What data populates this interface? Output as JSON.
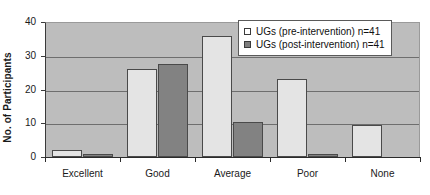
{
  "chart_data": {
    "type": "bar",
    "title": "",
    "xlabel": "",
    "ylabel": "No. of Participants",
    "ylim": [
      0,
      40
    ],
    "yticks": [
      0,
      10,
      20,
      30,
      40
    ],
    "grid": true,
    "legend_position": "top-right",
    "categories": [
      "Excellent",
      "Good",
      "Average",
      "Poor",
      "None"
    ],
    "series": [
      {
        "name": "UGs (pre-intervention) n=41",
        "swatch": "pre",
        "color": "#e4e4e4",
        "values": [
          2,
          26,
          36,
          23,
          9.5
        ]
      },
      {
        "name": "UGs (post-intervention) n=41",
        "swatch": "post",
        "color": "#828282",
        "values": [
          1,
          27.5,
          10.5,
          1,
          0
        ]
      }
    ]
  },
  "colors": {
    "plot_background": "#bdbdbd",
    "gridline": "#6e6e6e",
    "axis": "#2b2b2b",
    "bar_pre": "#e4e4e4",
    "bar_post": "#828282",
    "bar_border": "#4a4a4a",
    "legend_background": "#ffffff",
    "legend_border": "#5a5a5a",
    "text": "#1a1a1a"
  }
}
